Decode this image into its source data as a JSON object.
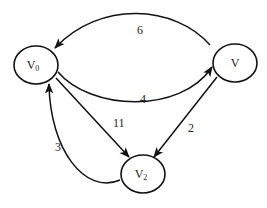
{
  "graph": {
    "type": "directed-weighted",
    "nodes": [
      {
        "id": "v0",
        "label": "V",
        "subscript": "0"
      },
      {
        "id": "v1",
        "label": "V",
        "subscript": ""
      },
      {
        "id": "v2",
        "label": "V",
        "subscript": "2"
      }
    ],
    "edges": [
      {
        "from": "v1",
        "to": "v0",
        "weight": "6"
      },
      {
        "from": "v0",
        "to": "v1",
        "weight": "4"
      },
      {
        "from": "v0",
        "to": "v2",
        "weight": "11"
      },
      {
        "from": "v1",
        "to": "v2",
        "weight": "2"
      },
      {
        "from": "v2",
        "to": "v0",
        "weight": "3"
      }
    ]
  },
  "colors": {
    "stroke": "#111111",
    "background": "#ffffff"
  }
}
